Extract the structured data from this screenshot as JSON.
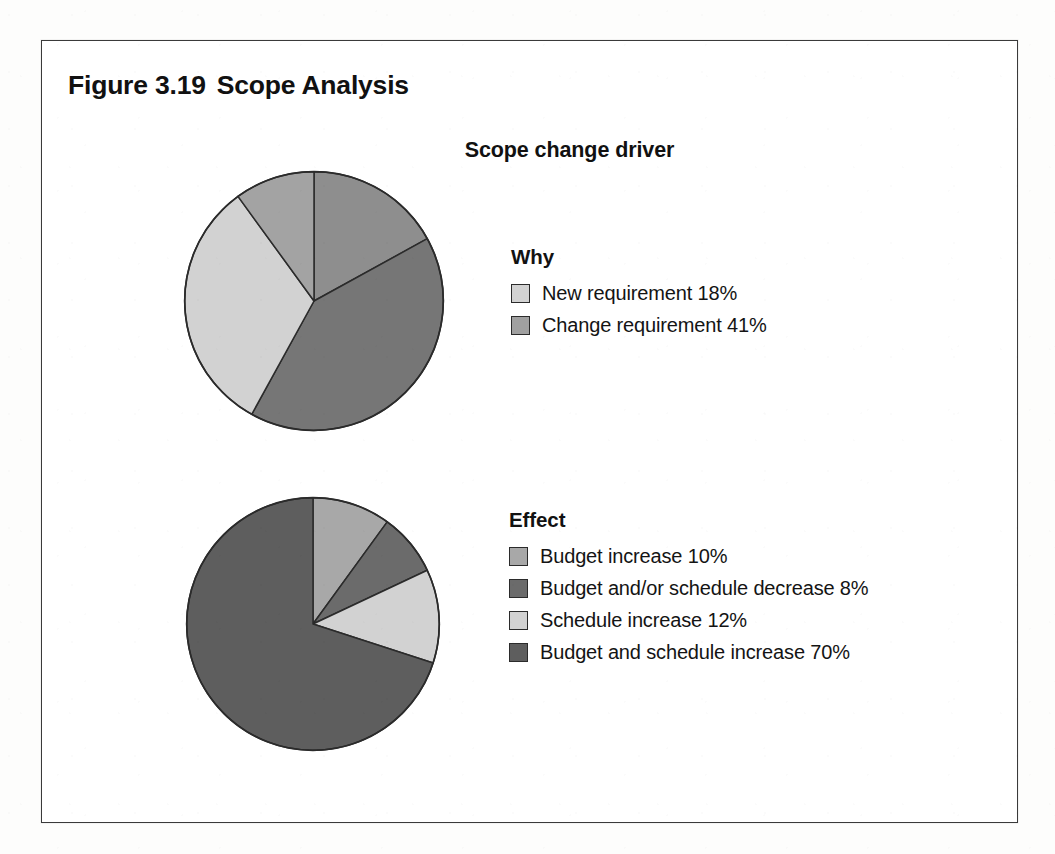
{
  "figure": {
    "number": "Figure 3.19",
    "name": "Scope Analysis",
    "chart_heading": "Scope change driver"
  },
  "palette": {
    "light": "#d2d2d2",
    "medium_light": "#b9b9b9",
    "medium": "#a0a0a0",
    "medium_dark": "#8a8a8a",
    "dark": "#6e6e6e",
    "darkest": "#5a5a5a",
    "outline": "#2b2b2b"
  },
  "legends": [
    {
      "id": "why",
      "title": "Why",
      "items": [
        {
          "label": "New requirement 18%",
          "color": "#d2d2d2"
        },
        {
          "label": "Change requirement 41%",
          "color": "#a0a0a0"
        }
      ]
    },
    {
      "id": "effect",
      "title": "Effect",
      "items": [
        {
          "label": "Budget increase 10%",
          "color": "#a8a8a8"
        },
        {
          "label": "Budget and/or schedule decrease 8%",
          "color": "#6b6b6b"
        },
        {
          "label": "Schedule increase 12%",
          "color": "#d2d2d2"
        },
        {
          "label": "Budget and schedule increase 70%",
          "color": "#5e5e5e"
        }
      ]
    }
  ],
  "chart_data": [
    {
      "type": "pie",
      "id": "scope-change-driver-why",
      "title": "Scope change driver",
      "subtitle": "Why",
      "start_angle_deg": 0,
      "direction": "clockwise",
      "categories": [
        "Change requirement 41%",
        "unlabeled slice",
        "New requirement 18%",
        "unlabeled slice"
      ],
      "labels": [
        "Change requirement",
        "",
        "New requirement",
        ""
      ],
      "values": [
        17,
        41,
        32,
        10
      ],
      "colors": [
        "#8e8e8e",
        "#767676",
        "#d2d2d2",
        "#a3a3a3"
      ],
      "legend_position": "right"
    },
    {
      "type": "pie",
      "id": "scope-change-driver-effect",
      "title": "Scope change driver",
      "subtitle": "Effect",
      "start_angle_deg": 0,
      "direction": "clockwise",
      "categories": [
        "Budget increase 10%",
        "Budget and/or schedule decrease 8%",
        "Schedule increase 12%",
        "Budget and schedule increase 70%"
      ],
      "labels": [
        "Budget increase",
        "Budget and/or schedule decrease",
        "Schedule increase",
        "Budget and schedule increase"
      ],
      "values": [
        10,
        8,
        12,
        70
      ],
      "colors": [
        "#a8a8a8",
        "#6b6b6b",
        "#d2d2d2",
        "#5e5e5e"
      ],
      "legend_position": "right"
    }
  ]
}
